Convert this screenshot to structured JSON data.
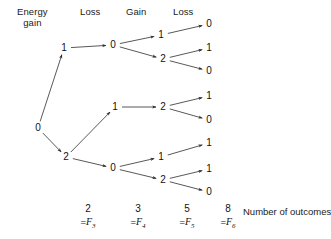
{
  "figure": {
    "type": "probability-tree-diagram",
    "stage_headers": [
      {
        "id": "energy-gain",
        "line1": "Energy",
        "line2": "gain",
        "x": 41,
        "y": 6
      },
      {
        "id": "loss-1",
        "line1": "Loss",
        "line2": "",
        "x": 92,
        "y": 6
      },
      {
        "id": "gain-1",
        "line1": "Gain",
        "line2": "",
        "x": 139,
        "y": 6
      },
      {
        "id": "loss-2",
        "line1": "Loss",
        "line2": "",
        "x": 186,
        "y": 6
      }
    ],
    "nodes": [
      {
        "id": "n-root",
        "label": "0",
        "x": 38,
        "y": 128,
        "level": 0
      },
      {
        "id": "n-l1-a",
        "label": "1",
        "x": 64,
        "y": 48,
        "level": 1
      },
      {
        "id": "n-l1-b",
        "label": "2",
        "x": 66,
        "y": 157,
        "level": 1
      },
      {
        "id": "n-l2-a",
        "label": "0",
        "x": 113,
        "y": 45,
        "level": 2
      },
      {
        "id": "n-l2-b",
        "label": "1",
        "x": 115,
        "y": 107,
        "level": 2
      },
      {
        "id": "n-l2-c",
        "label": "0",
        "x": 113,
        "y": 168,
        "level": 2
      },
      {
        "id": "n-l3-a",
        "label": "1",
        "x": 161,
        "y": 35,
        "level": 3
      },
      {
        "id": "n-l3-b",
        "label": "2",
        "x": 163,
        "y": 59,
        "level": 3
      },
      {
        "id": "n-l3-c",
        "label": "2",
        "x": 163,
        "y": 107,
        "level": 3
      },
      {
        "id": "n-l3-d",
        "label": "1",
        "x": 161,
        "y": 157,
        "level": 3
      },
      {
        "id": "n-l3-e",
        "label": "2",
        "x": 163,
        "y": 180,
        "level": 3
      },
      {
        "id": "n-l4-a",
        "label": "0",
        "x": 209,
        "y": 24,
        "level": 4
      },
      {
        "id": "n-l4-b",
        "label": "1",
        "x": 209,
        "y": 48,
        "level": 4
      },
      {
        "id": "n-l4-c",
        "label": "0",
        "x": 209,
        "y": 71,
        "level": 4
      },
      {
        "id": "n-l4-d",
        "label": "1",
        "x": 209,
        "y": 96,
        "level": 4
      },
      {
        "id": "n-l4-e",
        "label": "0",
        "x": 209,
        "y": 120,
        "level": 4
      },
      {
        "id": "n-l4-f",
        "label": "1",
        "x": 209,
        "y": 143,
        "level": 4
      },
      {
        "id": "n-l4-g",
        "label": "1",
        "x": 209,
        "y": 169,
        "level": 4
      },
      {
        "id": "n-l4-h",
        "label": "0",
        "x": 209,
        "y": 192,
        "level": 4
      }
    ],
    "edges": [
      {
        "from": "n-root",
        "to": "n-l1-a"
      },
      {
        "from": "n-root",
        "to": "n-l1-b"
      },
      {
        "from": "n-l1-a",
        "to": "n-l2-a"
      },
      {
        "from": "n-l1-b",
        "to": "n-l2-b"
      },
      {
        "from": "n-l1-b",
        "to": "n-l2-c"
      },
      {
        "from": "n-l2-a",
        "to": "n-l3-a"
      },
      {
        "from": "n-l2-a",
        "to": "n-l3-b"
      },
      {
        "from": "n-l2-b",
        "to": "n-l3-c"
      },
      {
        "from": "n-l2-c",
        "to": "n-l3-d"
      },
      {
        "from": "n-l2-c",
        "to": "n-l3-e"
      },
      {
        "from": "n-l3-a",
        "to": "n-l4-a"
      },
      {
        "from": "n-l3-b",
        "to": "n-l4-b"
      },
      {
        "from": "n-l3-b",
        "to": "n-l4-c"
      },
      {
        "from": "n-l3-c",
        "to": "n-l4-d"
      },
      {
        "from": "n-l3-c",
        "to": "n-l4-e"
      },
      {
        "from": "n-l3-d",
        "to": "n-l4-f"
      },
      {
        "from": "n-l3-e",
        "to": "n-l4-g"
      },
      {
        "from": "n-l3-e",
        "to": "n-l4-h"
      }
    ],
    "totals": [
      {
        "id": "total-f3",
        "count": "2",
        "eq": "=",
        "fname": "F",
        "fsub": "3",
        "x": 88,
        "y": 203
      },
      {
        "id": "total-f4",
        "count": "3",
        "eq": "=",
        "fname": "F",
        "fsub": "4",
        "x": 138,
        "y": 203
      },
      {
        "id": "total-f5",
        "count": "5",
        "eq": "=",
        "fname": "F",
        "fsub": "5",
        "x": 187,
        "y": 203
      },
      {
        "id": "total-f6",
        "count": "8",
        "eq": "=",
        "fname": "F",
        "fsub": "6",
        "x": 228,
        "y": 203
      }
    ],
    "caption": {
      "text": "Number of outcomes",
      "x": 243,
      "y": 212
    },
    "colors": {
      "ink": "#1a1a1a",
      "line": "#3a3a3a",
      "background": "#ffffff"
    }
  }
}
